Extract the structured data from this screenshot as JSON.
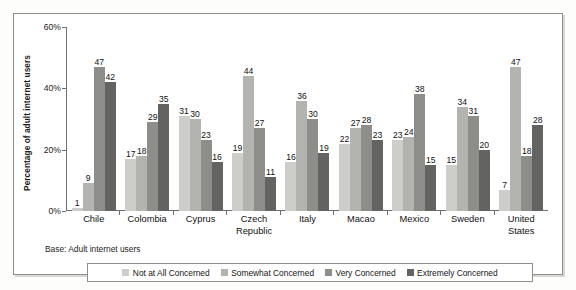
{
  "chart_data": {
    "type": "bar",
    "title": "",
    "subtitle": "",
    "xlabel": "",
    "ylabel": "Percentage of adult internet users",
    "ylim": [
      0,
      60
    ],
    "yticks": [
      0,
      20,
      40,
      60
    ],
    "ytick_labels": [
      "0%",
      "20%",
      "40%",
      "60%"
    ],
    "grid": false,
    "legend_position": "bottom",
    "base_note": "Base: Adult internet users",
    "categories": [
      "Chile",
      "Colombia",
      "Cyprus",
      "Czech Republic",
      "Italy",
      "Macao",
      "Mexico",
      "Sweden",
      "United States"
    ],
    "series": [
      {
        "name": "Not at All Concerned",
        "color": "#cdcdca",
        "values": [
          1,
          17,
          31,
          19,
          16,
          22,
          23,
          15,
          7
        ]
      },
      {
        "name": "Somewhat Concerned",
        "color": "#b3b3b0",
        "values": [
          9,
          18,
          30,
          44,
          36,
          27,
          24,
          34,
          47
        ]
      },
      {
        "name": "Very Concerned",
        "color": "#8d8d8a",
        "values": [
          47,
          29,
          23,
          27,
          30,
          28,
          38,
          31,
          18
        ]
      },
      {
        "name": "Extremely Concerned",
        "color": "#636361",
        "values": [
          42,
          35,
          16,
          11,
          19,
          23,
          15,
          20,
          28
        ]
      }
    ]
  },
  "legend": {
    "items": [
      {
        "label": "Not at All Concerned"
      },
      {
        "label": "Somewhat Concerned"
      },
      {
        "label": "Very Concerned"
      },
      {
        "label": "Extremely Concerned"
      }
    ]
  }
}
